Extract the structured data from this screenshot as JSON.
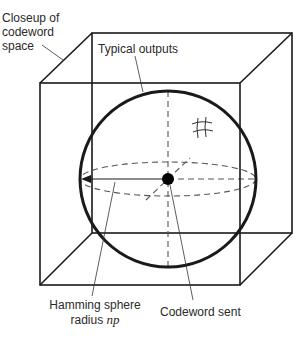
{
  "diagram": {
    "type": "hamming-sphere-codeword-space",
    "labels": {
      "closeup": [
        "Closeup of",
        "codeword",
        "space"
      ],
      "typical_outputs": "Typical outputs",
      "hamming_line1": "Hamming sphere",
      "hamming_line2_prefix": "radius ",
      "hamming_line2_math": "np",
      "codeword_sent": "Codeword sent"
    },
    "colors": {
      "stroke": "#1a1a1a",
      "dashed": "#555555",
      "text": "#2a2a2a"
    }
  }
}
